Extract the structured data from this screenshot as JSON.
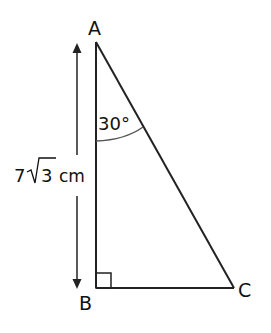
{
  "diagram": {
    "type": "right-triangle",
    "vertices": {
      "A": {
        "label": "A"
      },
      "B": {
        "label": "B"
      },
      "C": {
        "label": "C"
      }
    },
    "angle_A": {
      "label": "30°",
      "value_deg": 30
    },
    "right_angle_at": "B",
    "side_AB": {
      "label_prefix": "7",
      "label_radicand": "3",
      "label_unit": "cm"
    }
  }
}
